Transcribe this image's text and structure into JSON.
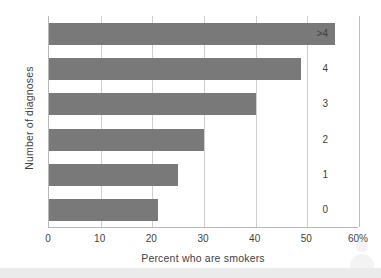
{
  "chart_data": {
    "type": "bar",
    "orientation": "horizontal",
    "title": "",
    "xlabel": "Percent who are smokers",
    "ylabel": "Number of diagnoses",
    "categories": [
      ">4",
      "4",
      "3",
      "2",
      "1",
      "0"
    ],
    "values": [
      55.3,
      48.7,
      40.0,
      30.0,
      25.0,
      21.0
    ],
    "xlim": [
      0,
      60
    ],
    "x_ticks": [
      0,
      10,
      20,
      30,
      40,
      50,
      60
    ],
    "x_tick_labels": [
      "0",
      "10",
      "20",
      "30",
      "40",
      "50",
      "60%"
    ],
    "grid": "vertical",
    "legend": "none",
    "bar_color": "#797979",
    "gridline_color": "#cfcfcf",
    "axis_color": "#b8b8b8",
    "background_color": "#ffffff"
  },
  "watermark": {
    "avatar_icon": "person-avatar-icon"
  }
}
